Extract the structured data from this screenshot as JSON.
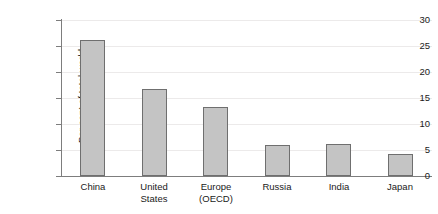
{
  "chart_data": {
    "type": "bar",
    "title": "",
    "xlabel": "",
    "ylabel": "Per cent of total world carbon emissions",
    "ylabel_lines": [
      "Per cent of total world",
      "carbon emissions"
    ],
    "categories": [
      "China",
      "United States",
      "Europe (OECD)",
      "Russia",
      "India",
      "Japan"
    ],
    "category_lines": [
      [
        "China"
      ],
      [
        "United",
        "States"
      ],
      [
        "Europe",
        "(OECD)"
      ],
      [
        "Russia"
      ],
      [
        "India"
      ],
      [
        "Japan"
      ]
    ],
    "values": [
      26.2,
      16.8,
      13.2,
      6.0,
      6.1,
      4.3
    ],
    "ylim": [
      0,
      30
    ],
    "ytick_values": [
      0,
      5,
      10,
      15,
      20,
      25,
      30
    ],
    "ytick_labels": [
      "0",
      "5",
      "10",
      "15",
      "20",
      "25",
      "30"
    ],
    "grid": true,
    "legend": "none",
    "colors": {
      "bar_fill": "#c4c4c4",
      "bar_border": "#6f6f6f",
      "axis": "#7d7d7d",
      "gridline": "#eceaea",
      "background": "#ffffff",
      "text": "#1a1a1a"
    }
  }
}
